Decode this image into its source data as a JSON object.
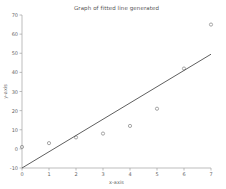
{
  "figure": {
    "title": "Graph of fitted line generated"
  },
  "chart_data": {
    "type": "scatter",
    "title": "Graph of fitted line generated",
    "xlabel": "x-axis",
    "ylabel": "y-axis",
    "xlim": [
      0,
      7
    ],
    "ylim": [
      -10,
      70
    ],
    "x_ticks": [
      0,
      1,
      2,
      3,
      4,
      5,
      6,
      7
    ],
    "y_ticks": [
      -10,
      0,
      10,
      20,
      30,
      40,
      50,
      60,
      70
    ],
    "grid": false,
    "legend": "none",
    "series": [
      {
        "name": "observed data points",
        "kind": "scatter",
        "marker": "open-circle",
        "x": [
          0,
          1,
          2,
          3,
          4,
          5,
          6,
          7
        ],
        "y": [
          1,
          3,
          6,
          8,
          12,
          21,
          42,
          65
        ]
      },
      {
        "name": "fitted line",
        "kind": "line",
        "x": [
          0,
          7
        ],
        "y": [
          -10,
          49.5
        ]
      }
    ],
    "colors": {
      "marker": "#8f8f8f",
      "fit_line": "#4d4d4d",
      "axis": "#a0a0a0",
      "tick_text": "#666666",
      "title_text": "#555555"
    }
  }
}
